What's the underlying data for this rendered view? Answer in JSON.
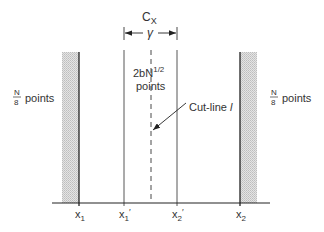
{
  "diagram": {
    "top_label": "C",
    "top_label_sub": "X",
    "gap_label": "γ",
    "center_label_line1": "2bN",
    "center_label_sup": "1/2",
    "center_label_line2": "points",
    "cutline_label": "Cut-line",
    "cutline_symbol": "l",
    "left_band_label_num": "N",
    "left_band_label_den": "8",
    "left_band_label_text": "points",
    "right_band_label_num": "N",
    "right_band_label_den": "8",
    "right_band_label_text": "points",
    "axis_labels": {
      "x1": "x",
      "x1_sub": "1",
      "x1p": "x",
      "x1p_sub": "1",
      "x1p_prime": "′",
      "x2p": "x",
      "x2p_sub": "2",
      "x2p_prime": "′",
      "x2": "x",
      "x2_sub": "2"
    }
  }
}
